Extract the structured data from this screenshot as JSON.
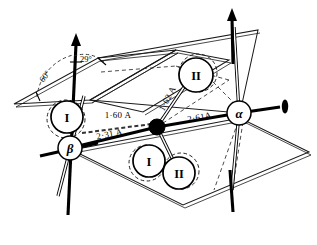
{
  "figure": {
    "background_color": "#ffffff",
    "line_color": "#000000"
  },
  "atoms": [
    {
      "id": "beta",
      "label": "β",
      "kind": "open-circle",
      "cx": 70,
      "cy": 148
    },
    {
      "id": "alpha",
      "label": "α",
      "kind": "open-circle",
      "cx": 239,
      "cy": 113
    },
    {
      "id": "center",
      "label": "",
      "kind": "filled-dot",
      "cx": 157,
      "cy": 127
    }
  ],
  "groups": [
    {
      "id": "group-I-upper-left",
      "label": "I",
      "cx": 67,
      "cy": 117
    },
    {
      "id": "group-II-upper",
      "label": "II",
      "cx": 196,
      "cy": 75
    },
    {
      "id": "group-I-lower",
      "label": "I",
      "cx": 149,
      "cy": 161
    },
    {
      "id": "group-II-lower",
      "label": "II",
      "cx": 179,
      "cy": 173
    }
  ],
  "distances": [
    {
      "id": "d-1-60",
      "text": "1·60 A",
      "x": 118,
      "y": 118,
      "rotation": 0
    },
    {
      "id": "d-2-31",
      "text": "2·31 A",
      "x": 110,
      "y": 137,
      "rotation": -11
    },
    {
      "id": "d-1-62",
      "text": "1·62 A",
      "x": 170,
      "y": 100,
      "rotation": -62
    },
    {
      "id": "d-2-61",
      "text": "2·61A",
      "x": 200,
      "y": 120,
      "rotation": -11
    }
  ],
  "angles": [
    {
      "id": "angle-60",
      "text": "60°",
      "x": 47,
      "y": 78,
      "rotation": -52
    },
    {
      "id": "angle-29",
      "text": "29°",
      "x": 86,
      "y": 62,
      "rotation": 0
    }
  ],
  "axes": [
    {
      "id": "axis-beta-vertical",
      "direction": "up",
      "arrow": true
    },
    {
      "id": "axis-alpha-vertical",
      "direction": "up",
      "arrow": true
    },
    {
      "id": "axis-alpha-right",
      "direction": "right",
      "arrow": true
    },
    {
      "id": "axis-beta-horizontal",
      "direction": "left",
      "arrow": false
    },
    {
      "id": "axis-alpha-down",
      "direction": "down",
      "arrow": false
    },
    {
      "id": "axis-beta-down",
      "direction": "down",
      "arrow": false
    }
  ],
  "planes": [
    {
      "id": "plane-upper-left",
      "style": "double-line-outline"
    },
    {
      "id": "plane-lower-right",
      "style": "double-line-outline"
    }
  ]
}
